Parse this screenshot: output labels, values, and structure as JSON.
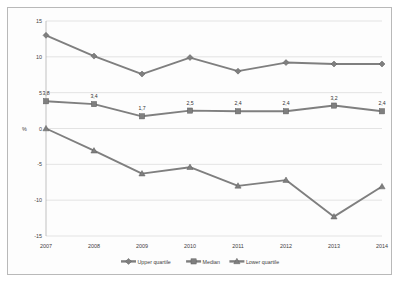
{
  "chart_data": {
    "type": "line",
    "title": "",
    "xlabel": "",
    "ylabel": "%",
    "categories": [
      "2007",
      "2008",
      "2009",
      "2010",
      "2011",
      "2012",
      "2013",
      "2014"
    ],
    "ylim": [
      -15,
      15
    ],
    "yticks": [
      15,
      10,
      5,
      0,
      -5,
      -10,
      -15
    ],
    "ytick_labels": [
      "15",
      "10",
      "5",
      "0",
      "-5",
      "-10",
      "-15"
    ],
    "grid": true,
    "legend_position": "bottom",
    "series": [
      {
        "name": "Upper quartile",
        "color": "#7f7f7f",
        "marker": "diamond",
        "values": [
          13.0,
          10.1,
          7.6,
          9.9,
          8.0,
          9.2,
          9.0,
          9.0
        ],
        "labels": [
          "",
          "",
          "",
          "",
          "",
          "",
          "",
          ""
        ]
      },
      {
        "name": "Median",
        "color": "#7f7f7f",
        "marker": "square",
        "values": [
          3.8,
          3.4,
          1.7,
          2.5,
          2.4,
          2.4,
          3.2,
          2.4
        ],
        "labels": [
          "3,8",
          "3,4",
          "1,7",
          "2,5",
          "2,4",
          "2,4",
          "3,2",
          "2,4"
        ]
      },
      {
        "name": "Lower quartile",
        "color": "#7f7f7f",
        "marker": "triangle",
        "values": [
          0.0,
          -3.1,
          -6.3,
          -5.4,
          -8.0,
          -7.2,
          -12.3,
          -8.1
        ],
        "labels": [
          "",
          "",
          "",
          "",
          "",
          "",
          "",
          ""
        ]
      }
    ]
  },
  "colors": {
    "line": "#7f7f7f",
    "grid": "#c8c8c8",
    "text": "#3d3d3d",
    "border": "#b9b9b9"
  }
}
